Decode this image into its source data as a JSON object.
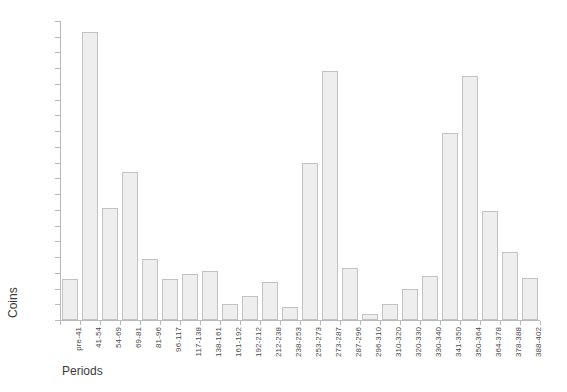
{
  "chart_data": {
    "type": "bar",
    "title": "",
    "subtitle": "",
    "xlabel": "Periods",
    "ylabel": "Coins",
    "ylim": [
      0,
      190
    ],
    "ytick_step": 10,
    "grid": false,
    "legend": null,
    "bar_fill_color": "#eeeeee",
    "bar_border_color": "#c2c2c2",
    "axis_color": "#b9b9b9",
    "background_color": "#ffffff",
    "categories": [
      "pre-41",
      "41-54",
      "54-69",
      "69-81",
      "81-96",
      "96-117",
      "117-138",
      "138-161",
      "161-192",
      "192-212",
      "212-238",
      "238-253",
      "253-273",
      "273-287",
      "287-296",
      "296-310",
      "310-320",
      "320-330",
      "330-340",
      "341-350",
      "350-364",
      "364-378",
      "378-388",
      "388-402"
    ],
    "values": [
      26,
      183,
      71,
      94,
      39,
      26,
      29,
      31,
      10,
      15,
      24,
      8,
      100,
      158,
      33,
      4,
      10,
      20,
      28,
      119,
      155,
      69,
      43,
      27
    ],
    "yticks": [
      "0",
      "10",
      "20",
      "30",
      "40",
      "50",
      "60",
      "70",
      "80",
      "90",
      "100",
      "110",
      "120",
      "130",
      "140",
      "150",
      "160",
      "170",
      "180",
      "190"
    ]
  }
}
